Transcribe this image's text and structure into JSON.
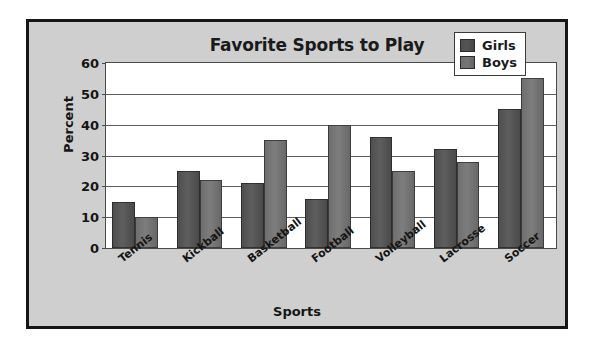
{
  "chart_data": {
    "type": "bar",
    "title": "Favorite Sports to Play",
    "xlabel": "Sports",
    "ylabel": "Percent",
    "ylim": [
      0,
      60
    ],
    "yticks": [
      0,
      10,
      20,
      30,
      40,
      50,
      60
    ],
    "grid": true,
    "legend_position": "top-right",
    "categories": [
      "Tennis",
      "Kickball",
      "Basketball",
      "Football",
      "Volleyball",
      "Lacrosse",
      "Soccer"
    ],
    "series": [
      {
        "name": "Girls",
        "color": "#545454",
        "values": [
          15,
          25,
          21,
          16,
          36,
          32,
          45
        ]
      },
      {
        "name": "Boys",
        "color": "#767676",
        "values": [
          10,
          22,
          35,
          40,
          25,
          28,
          55
        ]
      }
    ]
  },
  "colors": {
    "chart_background": "#cfcfcf",
    "plot_background": "#ffffff",
    "frame": "#161616",
    "gridline": "#5c5c5c",
    "text": "#151515"
  }
}
